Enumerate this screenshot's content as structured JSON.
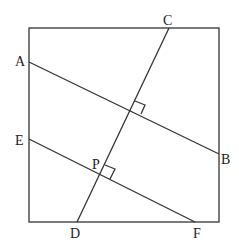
{
  "diagram": {
    "type": "geometry",
    "shape": "square",
    "square": {
      "x1": 29,
      "y1": 28,
      "x2": 219,
      "y2": 222
    },
    "points": {
      "A": {
        "label": "A",
        "x": 29,
        "y": 62
      },
      "B": {
        "label": "B",
        "x": 219,
        "y": 154
      },
      "C": {
        "label": "C",
        "x": 169,
        "y": 28
      },
      "D": {
        "label": "D",
        "x": 77,
        "y": 222
      },
      "E": {
        "label": "E",
        "x": 29,
        "y": 139
      },
      "F": {
        "label": "F",
        "x": 195,
        "y": 222
      },
      "P": {
        "label": "P",
        "x": 100,
        "y": 174
      }
    },
    "segments": [
      "AB",
      "CD",
      "EF"
    ],
    "right_angle_marks": [
      "AB ⟂ CD",
      "EF ⟂ CD at P"
    ]
  }
}
